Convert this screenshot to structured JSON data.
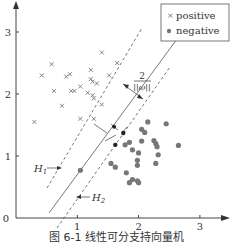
{
  "caption": "图 6-1   线性可分支持向量机",
  "chart_data": {
    "type": "scatter",
    "title": "",
    "xlabel": "",
    "ylabel": "",
    "xlim": [
      0,
      3.4
    ],
    "ylim": [
      0,
      3.5
    ],
    "x_ticks": [
      "1",
      "2",
      "3"
    ],
    "y_ticks": [
      "1",
      "2",
      "3"
    ],
    "origin_label": "0",
    "grid": false,
    "legend": {
      "position": "upper right",
      "entries": [
        "positive",
        "negative"
      ]
    },
    "series": [
      {
        "name": "positive",
        "marker": "x",
        "points": [
          [
            0.58,
            2.48
          ],
          [
            0.42,
            2.3
          ],
          [
            0.62,
            2.05
          ],
          [
            0.82,
            2.28
          ],
          [
            0.88,
            2.32
          ],
          [
            0.9,
            2.05
          ],
          [
            0.95,
            2.05
          ],
          [
            1.05,
            2.12
          ],
          [
            1.22,
            2.39
          ],
          [
            1.22,
            2.24
          ],
          [
            1.25,
            2.2
          ],
          [
            1.32,
            2.17
          ],
          [
            1.4,
            2.67
          ],
          [
            1.52,
            2.3
          ],
          [
            1.17,
            2.02
          ],
          [
            1.25,
            1.98
          ],
          [
            1.27,
            1.93
          ],
          [
            1.4,
            1.83
          ],
          [
            0.75,
            1.81
          ],
          [
            1.05,
            1.6
          ],
          [
            1.27,
            1.6
          ],
          [
            0.3,
            1.55
          ],
          [
            1.65,
            2.5
          ]
        ]
      },
      {
        "name": "negative",
        "marker": "o",
        "points": [
          [
            2.15,
            1.55
          ],
          [
            2.05,
            1.43
          ],
          [
            2.1,
            1.38
          ],
          [
            2.45,
            1.52
          ],
          [
            1.85,
            1.22
          ],
          [
            2.05,
            1.24
          ],
          [
            2.25,
            1.25
          ],
          [
            2.28,
            1.2
          ],
          [
            2.3,
            1.15
          ],
          [
            2.0,
            1.05
          ],
          [
            2.32,
            1.02
          ],
          [
            2.65,
            1.17
          ],
          [
            1.78,
            1.18
          ],
          [
            1.9,
            1.1
          ],
          [
            1.55,
            0.88
          ],
          [
            1.62,
            0.82
          ],
          [
            1.98,
            0.93
          ],
          [
            1.8,
            0.73
          ],
          [
            1.98,
            0.85
          ],
          [
            2.0,
            0.57
          ],
          [
            1.9,
            0.62
          ],
          [
            1.85,
            0.57
          ],
          [
            1.98,
            0.6
          ],
          [
            2.28,
            0.88
          ],
          [
            1.05,
            0.77
          ]
        ]
      }
    ],
    "support_vectors": {
      "positive": [
        [
          1.6,
          1.47
        ]
      ],
      "negative": [
        [
          1.75,
          1.37
        ],
        [
          1.62,
          1.18
        ]
      ]
    },
    "lines": [
      {
        "name": "hyperplane",
        "style": "solid"
      },
      {
        "name": "H1",
        "style": "dashed"
      },
      {
        "name": "H2",
        "style": "dashed"
      }
    ],
    "annotations": [
      "H1",
      "H2",
      "2/||ω||"
    ]
  },
  "labels": {
    "h1": "H",
    "h1_sub": "1",
    "h2": "H",
    "h2_sub": "2",
    "margin_num": "2",
    "margin_den": "||ω||",
    "legend_pos": "positive",
    "legend_neg": "negative"
  }
}
